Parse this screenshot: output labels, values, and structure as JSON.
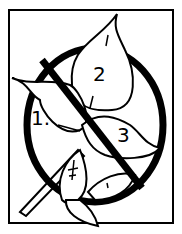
{
  "illustration": {
    "subject": "no-leaves-of-three warning sign",
    "colors": {
      "ink": "#000000",
      "paper": "#ffffff"
    },
    "leaf_labels": [
      {
        "id": "leaf-1",
        "label": "1."
      },
      {
        "id": "leaf-2",
        "label": "2"
      },
      {
        "id": "leaf-3",
        "label": "3"
      }
    ]
  }
}
